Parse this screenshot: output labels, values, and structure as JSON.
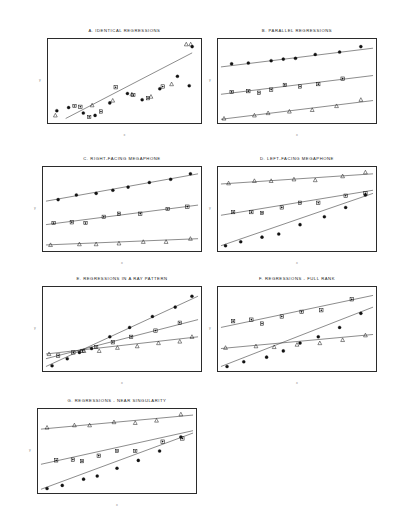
{
  "figure": {
    "axis_x_label": "x",
    "axis_y_label": "y",
    "background": "#ffffff",
    "line_color": "#2b2b2b",
    "frame_color": "#2b2b2b"
  },
  "markers": {
    "group1": "filled-circle",
    "group2": "star-square",
    "group3": "open-triangle"
  },
  "panels": [
    {
      "id": "A",
      "title": "A.  IDENTICAL REGRESSIONS",
      "x": 47,
      "y": 38,
      "w": 155,
      "h": 86
    },
    {
      "id": "B",
      "title": "B.  PARALLEL REGRESSIONS",
      "x": 217,
      "y": 38,
      "w": 160,
      "h": 86
    },
    {
      "id": "C",
      "title": "C.  RIGHT-FACING MEGAPHONE",
      "x": 42,
      "y": 166,
      "w": 160,
      "h": 86
    },
    {
      "id": "D",
      "title": "D.  LEFT-FACING MEGAPHONE",
      "x": 217,
      "y": 166,
      "w": 160,
      "h": 86
    },
    {
      "id": "E",
      "title": "E.  REGRESSIONS IN A RAY PATTERN",
      "x": 42,
      "y": 286,
      "w": 160,
      "h": 86
    },
    {
      "id": "F",
      "title": "F.  REGRESSIONS - FULL RANK",
      "x": 217,
      "y": 286,
      "w": 160,
      "h": 86
    },
    {
      "id": "G",
      "title": "G.  REGRESSIONS - NEAR SINGULARITY",
      "x": 37,
      "y": 408,
      "w": 160,
      "h": 86
    }
  ],
  "chart_data": {
    "type": "scatter",
    "xlabel": "x",
    "ylabel": "y",
    "xlim": [
      0,
      100
    ],
    "ylim": [
      0,
      100
    ],
    "grid": false,
    "legend": "none",
    "marker_groups": [
      "filled-circle",
      "star-square",
      "open-triangle"
    ],
    "panels": [
      {
        "id": "A",
        "title": "A.  IDENTICAL REGRESSIONS",
        "description": "All three groups share one common regression line; points scatter widely about it.",
        "lines": [
          {
            "group": "all",
            "x1": 10,
            "y1": 2,
            "x2": 96,
            "y2": 86
          }
        ],
        "series": [
          {
            "name": "filled-circle",
            "x": [
              4,
              12,
              22,
              30,
              40,
              52,
              62,
              74,
              86,
              94,
              96
            ],
            "y": [
              12,
              16,
              9,
              6,
              22,
              34,
              26,
              40,
              56,
              44,
              94
            ]
          },
          {
            "name": "star-square",
            "x": [
              16,
              20,
              26,
              34,
              44,
              56,
              66,
              76
            ],
            "y": [
              18,
              17,
              4,
              11,
              42,
              32,
              28,
              43
            ]
          },
          {
            "name": "open-triangle",
            "x": [
              3,
              28,
              42,
              55,
              68,
              82,
              92,
              95
            ],
            "y": [
              6,
              19,
              25,
              33,
              30,
              46,
              97,
              97
            ]
          }
        ]
      },
      {
        "id": "B",
        "title": "B.  PARALLEL REGRESSIONS",
        "description": "Three regression lines with equal slopes and different intercepts.",
        "lines": [
          {
            "group": "filled-circle",
            "x1": 0,
            "y1": 68,
            "x2": 100,
            "y2": 92
          },
          {
            "group": "star-square",
            "x1": 0,
            "y1": 33,
            "x2": 100,
            "y2": 57
          },
          {
            "group": "open-triangle",
            "x1": 0,
            "y1": 1,
            "x2": 100,
            "y2": 25
          }
        ],
        "series": [
          {
            "name": "filled-circle",
            "x": [
              7,
              18,
              33,
              41,
              49,
              62,
              78,
              92
            ],
            "y": [
              72,
              73,
              76,
              78,
              79,
              84,
              87,
              94
            ]
          },
          {
            "name": "star-square",
            "x": [
              7,
              18,
              25,
              33,
              42,
              52,
              64,
              80
            ],
            "y": [
              36,
              37,
              35,
              39,
              45,
              43,
              46,
              53
            ]
          },
          {
            "name": "open-triangle",
            "x": [
              2,
              22,
              31,
              45,
              60,
              76,
              92
            ],
            "y": [
              2,
              6,
              9,
              11,
              13,
              18,
              26
            ]
          }
        ]
      },
      {
        "id": "C",
        "title": "C.  RIGHT-FACING MEGAPHONE",
        "description": "Lines fan out to the right: slopes increase with group level.",
        "lines": [
          {
            "group": "filled-circle",
            "x1": 0,
            "y1": 60,
            "x2": 100,
            "y2": 95
          },
          {
            "group": "star-square",
            "x1": 0,
            "y1": 30,
            "x2": 100,
            "y2": 55
          },
          {
            "group": "open-triangle",
            "x1": 0,
            "y1": 4,
            "x2": 100,
            "y2": 12
          }
        ],
        "series": [
          {
            "name": "filled-circle",
            "x": [
              8,
              20,
              33,
              44,
              54,
              68,
              82,
              95
            ],
            "y": [
              62,
              68,
              70,
              74,
              78,
              84,
              88,
              95
            ]
          },
          {
            "name": "star-square",
            "x": [
              5,
              17,
              26,
              38,
              48,
              62,
              80,
              93
            ],
            "y": [
              32,
              33,
              32,
              40,
              44,
              44,
              50,
              53
            ]
          },
          {
            "name": "open-triangle",
            "x": [
              3,
              22,
              33,
              48,
              64,
              79,
              95
            ],
            "y": [
              4,
              5,
              5,
              6,
              8,
              8,
              12
            ]
          }
        ]
      },
      {
        "id": "D",
        "title": "D.  LEFT-FACING MEGAPHONE",
        "description": "Lines converge to the right: slopes decrease with group level.",
        "lines": [
          {
            "group": "open-triangle",
            "x1": 0,
            "y1": 82,
            "x2": 100,
            "y2": 95
          },
          {
            "group": "star-square",
            "x1": 0,
            "y1": 42,
            "x2": 100,
            "y2": 74
          },
          {
            "group": "filled-circle",
            "x1": 0,
            "y1": 3,
            "x2": 100,
            "y2": 70
          }
        ],
        "series": [
          {
            "name": "open-triangle",
            "x": [
              5,
              22,
              33,
              48,
              62,
              80,
              95
            ],
            "y": [
              83,
              86,
              86,
              88,
              87,
              92,
              97
            ]
          },
          {
            "name": "star-square",
            "x": [
              8,
              20,
              27,
              40,
              52,
              64,
              82,
              95
            ],
            "y": [
              46,
              46,
              45,
              52,
              58,
              58,
              67,
              70
            ]
          },
          {
            "name": "filled-circle",
            "x": [
              3,
              13,
              27,
              38,
              52,
              68,
              82,
              95
            ],
            "y": [
              3,
              8,
              14,
              18,
              30,
              40,
              52,
              68
            ]
          }
        ]
      },
      {
        "id": "E",
        "title": "E.  REGRESSIONS IN A RAY PATTERN",
        "description": "All three lines pass through a common point near the left edge, radiating outward.",
        "lines": [
          {
            "group": "filled-circle",
            "x1": 0,
            "y1": 2,
            "x2": 100,
            "y2": 92
          },
          {
            "group": "star-square",
            "x1": 0,
            "y1": 12,
            "x2": 100,
            "y2": 62
          },
          {
            "group": "open-triangle",
            "x1": 0,
            "y1": 18,
            "x2": 100,
            "y2": 40
          }
        ],
        "series": [
          {
            "name": "filled-circle",
            "x": [
              4,
              14,
              22,
              30,
              42,
              55,
              70,
              85,
              96
            ],
            "y": [
              3,
              12,
              20,
              25,
              40,
              52,
              66,
              78,
              92
            ]
          },
          {
            "name": "star-square",
            "x": [
              8,
              18,
              24,
              33,
              44,
              56,
              72,
              88
            ],
            "y": [
              16,
              20,
              22,
              27,
              33,
              40,
              48,
              58
            ]
          },
          {
            "name": "open-triangle",
            "x": [
              2,
              25,
              35,
              47,
              60,
              74,
              88,
              96
            ],
            "y": [
              18,
              22,
              22,
              26,
              28,
              32,
              34,
              40
            ]
          }
        ]
      },
      {
        "id": "F",
        "title": "F.  REGRESSIONS - FULL RANK",
        "description": "Lines of differing slope and intercept that cross within the plotting region.",
        "lines": [
          {
            "group": "star-square",
            "x1": 0,
            "y1": 52,
            "x2": 100,
            "y2": 93
          },
          {
            "group": "filled-circle",
            "x1": 0,
            "y1": 2,
            "x2": 100,
            "y2": 78
          },
          {
            "group": "open-triangle",
            "x1": 0,
            "y1": 25,
            "x2": 100,
            "y2": 43
          }
        ],
        "series": [
          {
            "name": "star-square",
            "x": [
              8,
              20,
              27,
              40,
              53,
              66,
              86
            ],
            "y": [
              60,
              62,
              57,
              66,
              72,
              74,
              88
            ]
          },
          {
            "name": "filled-circle",
            "x": [
              4,
              15,
              30,
              41,
              52,
              64,
              78,
              92
            ],
            "y": [
              2,
              8,
              14,
              22,
              32,
              40,
              52,
              70
            ]
          },
          {
            "name": "open-triangle",
            "x": [
              3,
              23,
              35,
              50,
              65,
              80,
              95
            ],
            "y": [
              26,
              28,
              27,
              30,
              32,
              36,
              42
            ]
          }
        ]
      },
      {
        "id": "G",
        "title": "G.  REGRESSIONS - NEAR SINGULARITY",
        "description": "Nearly collinear design: slopes differ only slightly, producing an ill-conditioned fit.",
        "lines": [
          {
            "group": "open-triangle",
            "x1": 0,
            "y1": 78,
            "x2": 100,
            "y2": 96
          },
          {
            "group": "star-square",
            "x1": 0,
            "y1": 33,
            "x2": 100,
            "y2": 76
          },
          {
            "group": "filled-circle",
            "x1": 0,
            "y1": 1,
            "x2": 100,
            "y2": 73
          }
        ],
        "series": [
          {
            "name": "open-triangle",
            "x": [
              4,
              22,
              32,
              48,
              62,
              76,
              92
            ],
            "y": [
              80,
              83,
              83,
              87,
              86,
              89,
              97
            ]
          },
          {
            "name": "star-square",
            "x": [
              10,
              21,
              27,
              38,
              50,
              62,
              80,
              93
            ],
            "y": [
              38,
              39,
              37,
              44,
              50,
              50,
              62,
              66
            ]
          },
          {
            "name": "filled-circle",
            "x": [
              4,
              14,
              28,
              37,
              50,
              64,
              78,
              92
            ],
            "y": [
              2,
              6,
              14,
              18,
              28,
              38,
              50,
              68
            ]
          }
        ]
      }
    ]
  }
}
